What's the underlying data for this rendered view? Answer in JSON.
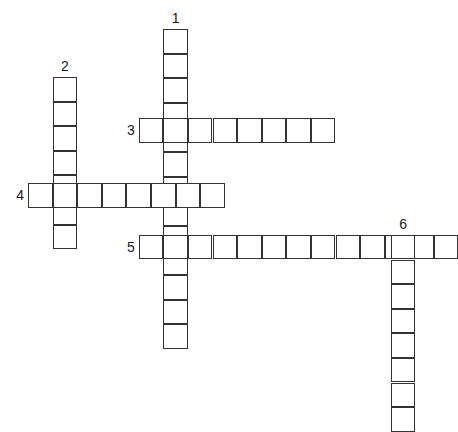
{
  "puzzle": {
    "title": "Crossword puzzle grid",
    "cell_size": 24.6,
    "origin_x": 28,
    "origin_y": 29,
    "stroke_color": "#333333",
    "cell_fill": "#ffffff",
    "background": "#ffffff",
    "number_color": "#1a1a1a",
    "entries": [
      {
        "number": "1",
        "direction": "down",
        "length": 13,
        "start_col": 5.5,
        "start_row": 0,
        "label_position": "above",
        "clipped": false
      },
      {
        "number": "2",
        "direction": "down",
        "length": 7,
        "start_col": 1,
        "start_row": 1.95,
        "label_position": "above",
        "clipped": false
      },
      {
        "number": "3",
        "direction": "across",
        "length": 8,
        "start_col": 4.5,
        "start_row": 3.62,
        "label_position": "left",
        "clipped": false
      },
      {
        "number": "4",
        "direction": "across",
        "length": 8,
        "start_col": 0,
        "start_row": 6.26,
        "label_position": "left",
        "clipped": false
      },
      {
        "number": "5",
        "direction": "across",
        "length": 13,
        "start_col": 4.5,
        "start_row": 8.37,
        "label_position": "left",
        "clipped": true
      },
      {
        "number": "6",
        "direction": "down",
        "length": 8,
        "start_col": 14.75,
        "start_row": 8.37,
        "label_position": "above",
        "clipped": true
      }
    ]
  }
}
